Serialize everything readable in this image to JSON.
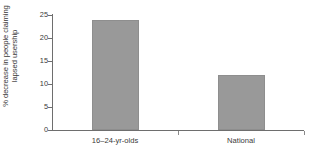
{
  "chart_data": {
    "type": "bar",
    "title": "",
    "xlabel": "",
    "ylabel": "% decrease in people claiming lapsed usership",
    "ylabel_lines": [
      "% decrease in people claiming",
      "lapsed usership"
    ],
    "categories": [
      "16–24-yr-olds",
      "National"
    ],
    "values": [
      24,
      12
    ],
    "ylim": [
      0,
      25
    ],
    "yticks": [
      0,
      5,
      10,
      15,
      20,
      25
    ],
    "ytick_labels": [
      "0",
      "5",
      "10",
      "15",
      "20",
      "25"
    ],
    "grid": false,
    "legend": null,
    "colors": {
      "bar_fill": "#999999",
      "bar_edge": "#8e8e8e",
      "axis": "#6e6e6e",
      "text": "#3a3a3a",
      "background": "#ffffff"
    }
  }
}
